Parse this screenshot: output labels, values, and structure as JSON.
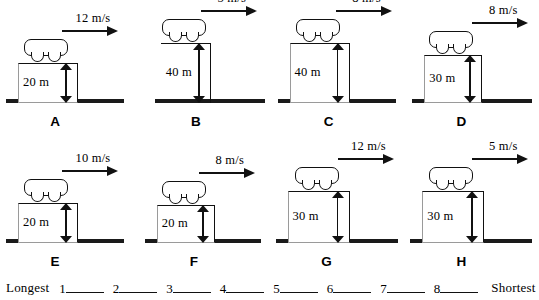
{
  "worksheet": {
    "ranking": {
      "longest_label": "Longest",
      "shortest_label": "Shortest",
      "slots": [
        "1",
        "2",
        "3",
        "4",
        "5",
        "6",
        "7",
        "8"
      ]
    }
  },
  "panels": [
    {
      "letter": "A",
      "velocity": "12 m/s",
      "velocity_value": 12,
      "velocity_units": "m/s",
      "height": "20 m",
      "height_value": 20,
      "height_units": "m",
      "platform_style": "box"
    },
    {
      "letter": "B",
      "velocity": "5 m/s",
      "velocity_value": 5,
      "velocity_units": "m/s",
      "height": "40 m",
      "height_value": 40,
      "height_units": "m",
      "platform_style": "thin"
    },
    {
      "letter": "C",
      "velocity": "8 m/s",
      "velocity_value": 8,
      "velocity_units": "m/s",
      "height": "40 m",
      "height_value": 40,
      "height_units": "m",
      "platform_style": "box"
    },
    {
      "letter": "D",
      "velocity": "8 m/s",
      "velocity_value": 8,
      "velocity_units": "m/s",
      "height": "30 m",
      "height_value": 30,
      "height_units": "m",
      "platform_style": "box"
    },
    {
      "letter": "E",
      "velocity": "10 m/s",
      "velocity_value": 10,
      "velocity_units": "m/s",
      "height": "20 m",
      "height_value": 20,
      "height_units": "m",
      "platform_style": "box"
    },
    {
      "letter": "F",
      "velocity": "8 m/s",
      "velocity_value": 8,
      "velocity_units": "m/s",
      "height": "20 m",
      "height_value": 20,
      "height_units": "m",
      "platform_style": "box"
    },
    {
      "letter": "G",
      "velocity": "12 m/s",
      "velocity_value": 12,
      "velocity_units": "m/s",
      "height": "30 m",
      "height_value": 30,
      "height_units": "m",
      "platform_style": "box"
    },
    {
      "letter": "H",
      "velocity": "5 m/s",
      "velocity_value": 5,
      "velocity_units": "m/s",
      "height": "30 m",
      "height_value": 30,
      "height_units": "m",
      "platform_style": "box"
    }
  ],
  "colors": {
    "ink": "#111111",
    "ground": "#1a1a1a",
    "faint_edge": "#9a9a9a",
    "paper": "#ffffff"
  }
}
